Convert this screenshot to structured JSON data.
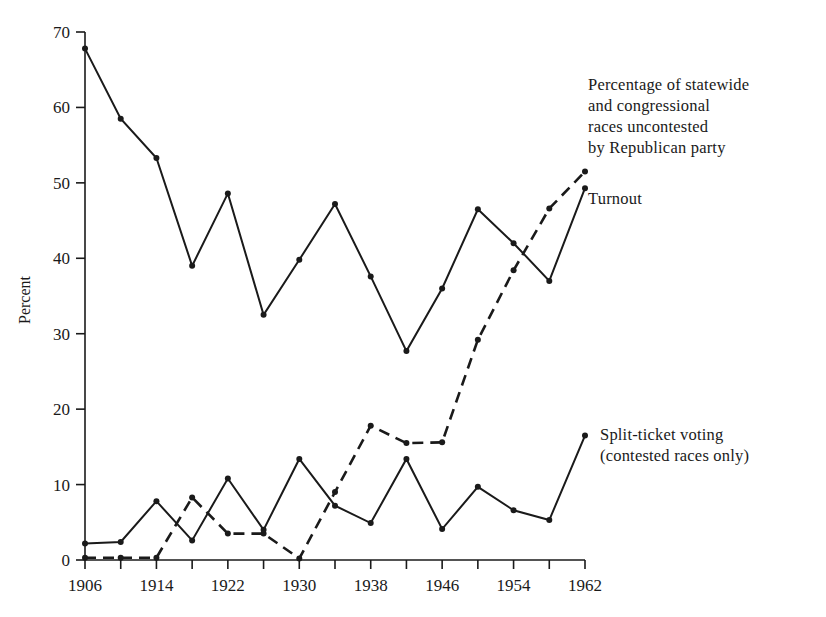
{
  "figure": {
    "background": "#ffffff",
    "ink_color": "#1a1a1a"
  },
  "axes": {
    "y_title": "Percent",
    "y_ticks": [
      "0",
      "10",
      "20",
      "30",
      "40",
      "50",
      "60",
      "70"
    ],
    "x_ticks": [
      "1906",
      "1914",
      "1922",
      "1930",
      "1938",
      "1946",
      "1954",
      "1962"
    ]
  },
  "annotations": {
    "uncontested": "Percentage of statewide\nand congressional\nraces uncontested\nby Republican party",
    "turnout": "Turnout",
    "split_ticket": "Split-ticket voting\n(contested races only)"
  },
  "chart_data": {
    "type": "line",
    "title": "",
    "xlabel": "",
    "ylabel": "Percent",
    "xlim": [
      1906,
      1962
    ],
    "ylim": [
      0,
      70
    ],
    "x_tick_step": 8,
    "x_minor_tick_step": 4,
    "y_tick_step": 10,
    "grid": false,
    "legend_position": "inline-right-annotations",
    "x": [
      1906,
      1910,
      1914,
      1918,
      1922,
      1926,
      1930,
      1934,
      1938,
      1942,
      1946,
      1950,
      1954,
      1958,
      1962
    ],
    "series": [
      {
        "name": "Turnout",
        "style": "solid",
        "marker": "dot",
        "values": [
          67.8,
          58.5,
          53.3,
          39.0,
          48.6,
          32.5,
          39.8,
          47.2,
          37.6,
          27.7,
          36.0,
          46.5,
          42.0,
          37.0,
          49.3
        ]
      },
      {
        "name": "Percentage of statewide and congressional races uncontested by Republican party",
        "style": "dashed",
        "marker": "dot",
        "values": [
          0.3,
          0.3,
          0.3,
          8.3,
          3.5,
          3.5,
          0.2,
          9.0,
          17.8,
          15.5,
          15.6,
          29.2,
          38.4,
          46.6,
          51.5
        ]
      },
      {
        "name": "Split-ticket voting (contested races only)",
        "style": "solid",
        "marker": "dot",
        "values": [
          2.2,
          2.4,
          7.8,
          2.6,
          10.8,
          4.0,
          13.4,
          7.2,
          4.9,
          13.4,
          4.1,
          9.7,
          6.6,
          5.3,
          16.5
        ]
      }
    ]
  }
}
